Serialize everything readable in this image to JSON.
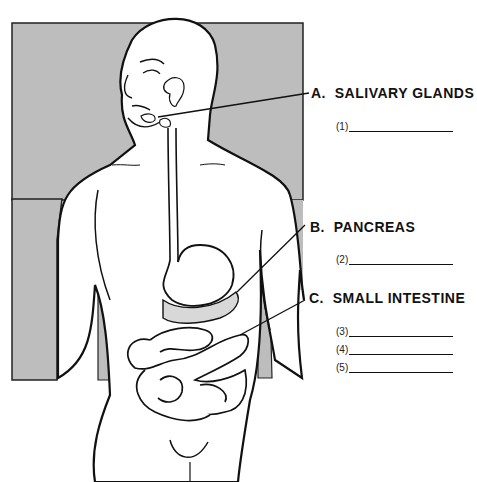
{
  "diagram": {
    "background_box_color": "#bdbdbd",
    "labels": [
      {
        "letter": "A.",
        "text": "SALIVARY GLANDS",
        "blanks": [
          "(1)"
        ]
      },
      {
        "letter": "B.",
        "text": "PANCREAS",
        "blanks": [
          "(2)"
        ]
      },
      {
        "letter": "C.",
        "text": "SMALL INTESTINE",
        "blanks": [
          "(3)",
          "(4)",
          "(5)"
        ]
      }
    ]
  }
}
